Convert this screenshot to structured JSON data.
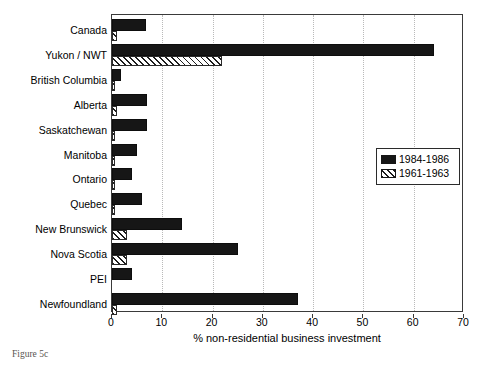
{
  "caption": "Figure 5c",
  "chart_data": {
    "type": "bar",
    "orientation": "horizontal",
    "title": "",
    "xlabel": "% non-residential business investment",
    "ylabel": "",
    "xlim": [
      0,
      70
    ],
    "xticks": [
      0,
      10,
      20,
      30,
      40,
      50,
      60,
      70
    ],
    "xtick_labels": [
      "0",
      "10",
      "20",
      "30",
      "40",
      "50",
      "60",
      "70"
    ],
    "grid": "vertical-dotted",
    "legend_position": "right-middle",
    "categories": [
      "Canada",
      "Yukon / NWT",
      "British Columbia",
      "Alberta",
      "Saskatchewan",
      "Manitoba",
      "Ontario",
      "Quebec",
      "New Brunswick",
      "Nova Scotia",
      "PEI",
      "Newfoundland"
    ],
    "series": [
      {
        "name": "1984-1986",
        "style": "solid-black",
        "color": "#161616",
        "values": [
          6.8,
          64.0,
          1.7,
          6.9,
          6.9,
          4.9,
          4.0,
          5.9,
          14.0,
          25.0,
          4.0,
          37.0
        ]
      },
      {
        "name": "1961-1963",
        "style": "diagonal-hatch",
        "color": "#ffffff",
        "values": [
          0.9,
          21.8,
          0.5,
          0.9,
          0.4,
          0.4,
          0.4,
          0.4,
          3.0,
          3.0,
          0.0,
          0.9
        ]
      }
    ]
  }
}
